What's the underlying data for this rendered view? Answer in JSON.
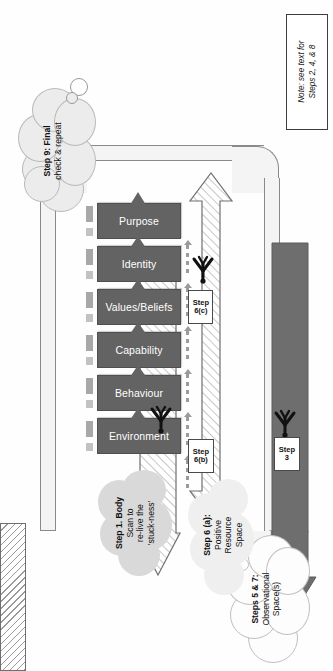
{
  "diagram": {
    "orientation": "rotated-90",
    "note": {
      "line1": "Note: see text for",
      "line2": "Steps 2, 4, & 8"
    },
    "levels": [
      {
        "id": "environment",
        "label": "Environment"
      },
      {
        "id": "behaviour",
        "label": "Behaviour"
      },
      {
        "id": "capability",
        "label": "Capability"
      },
      {
        "id": "values",
        "label": "Values/Beliefs"
      },
      {
        "id": "identity",
        "label": "Identity"
      },
      {
        "id": "purpose",
        "label": "Purpose"
      }
    ],
    "step_labels": [
      {
        "id": "step-3",
        "line1": "Step",
        "line2": "3"
      },
      {
        "id": "step-6b",
        "line1": "Step",
        "line2": "6(b)"
      },
      {
        "id": "step-6c",
        "line1": "Step",
        "line2": "6(c)"
      }
    ],
    "clouds": [
      {
        "id": "step-9",
        "bold": "Step 9:",
        "rest": " Final check  & repeat",
        "l1": "Step 9: Final",
        "l2": "check  & repeat"
      },
      {
        "id": "step-1",
        "l1": "Step 1. Body",
        "l2": "Scan to",
        "l3": "re-live the",
        "l4": "'stuck-ness'"
      },
      {
        "id": "steps-5-7",
        "l1": "Steps 5 & 7:",
        "l2": "Observational",
        "l3": "Space(s)"
      },
      {
        "id": "step-6a",
        "l1": "Step 6 (a):",
        "l2": "Positive",
        "l3": "Resource",
        "l4": "Space"
      }
    ],
    "colors": {
      "box_fill": "#636363",
      "box_text": "#ffffff",
      "dark_arrow": "#6e6e6e",
      "connector": "#9b9b9b",
      "stub": "#c2c2c2",
      "hatch_line": "#9a9a9a",
      "ribbon_border": "#8a8a8a",
      "cloud_fill_light": "#f2f2f2",
      "cloud_fill_grey": "#d8d8d8",
      "note_border": "#3d3d3d"
    }
  }
}
